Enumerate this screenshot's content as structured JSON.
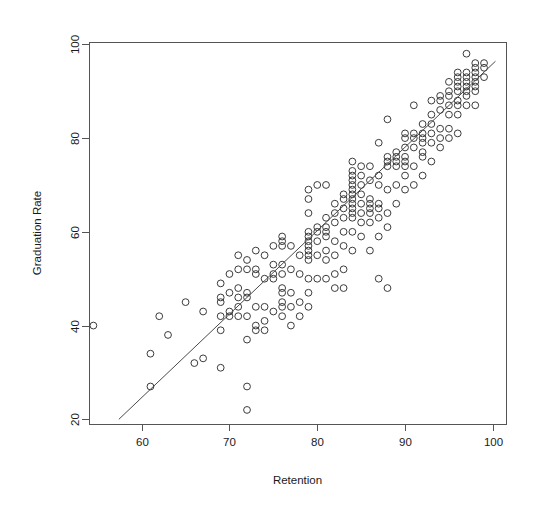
{
  "chart_data": {
    "type": "scatter",
    "title": "",
    "subtitle": "",
    "xlabel": "Retention",
    "ylabel": "Graduation Rate",
    "xlim": [
      54,
      101.5
    ],
    "ylim": [
      19,
      100.5
    ],
    "xticks": [
      60,
      70,
      80,
      90,
      100
    ],
    "yticks": [
      20,
      40,
      60,
      80,
      100
    ],
    "xticklabels": [
      "60",
      "70",
      "80",
      "90",
      "100"
    ],
    "yticklabels": [
      "20",
      "40",
      "60",
      "80",
      "100"
    ],
    "grid": false,
    "legend": null,
    "annotations": [],
    "marker": {
      "shape": "open-circle",
      "radius_px": 3.4,
      "stroke": "#3b3b3b",
      "fill": "none"
    },
    "fit_line": {
      "type": "linear-regression",
      "stroke": "#4a4a4a",
      "x_start": 57.4,
      "y_start": 20.0,
      "x_end": 100.3,
      "y_end": 96.4,
      "slope": 1.78,
      "intercept": -82.2
    },
    "series": [
      {
        "name": "Colleges",
        "n_points": 221,
        "points": [
          [
            54.5,
            40.0
          ],
          [
            61.0,
            27.0
          ],
          [
            61.0,
            34.0
          ],
          [
            62.0,
            42.0
          ],
          [
            63.0,
            38.0
          ],
          [
            65.0,
            45.0
          ],
          [
            66.0,
            32.0
          ],
          [
            67.0,
            33.0
          ],
          [
            67.0,
            43.0
          ],
          [
            69.0,
            31.0
          ],
          [
            69.0,
            39.0
          ],
          [
            69.0,
            42.0
          ],
          [
            69.0,
            45.0
          ],
          [
            69.0,
            46.0
          ],
          [
            69.0,
            49.0
          ],
          [
            70.0,
            42.0
          ],
          [
            70.0,
            43.0
          ],
          [
            70.0,
            47.0
          ],
          [
            70.0,
            51.0
          ],
          [
            71.0,
            42.0
          ],
          [
            71.0,
            44.0
          ],
          [
            71.0,
            46.0
          ],
          [
            71.0,
            48.0
          ],
          [
            71.0,
            52.0
          ],
          [
            71.0,
            55.0
          ],
          [
            72.0,
            22.0
          ],
          [
            72.0,
            27.0
          ],
          [
            72.0,
            37.0
          ],
          [
            72.0,
            42.0
          ],
          [
            72.0,
            46.0
          ],
          [
            72.0,
            47.0
          ],
          [
            72.0,
            52.0
          ],
          [
            72.0,
            54.0
          ],
          [
            73.0,
            39.0
          ],
          [
            73.0,
            40.0
          ],
          [
            73.0,
            44.0
          ],
          [
            73.0,
            51.0
          ],
          [
            73.0,
            52.0
          ],
          [
            73.0,
            56.0
          ],
          [
            74.0,
            39.0
          ],
          [
            74.0,
            41.0
          ],
          [
            74.0,
            44.0
          ],
          [
            74.0,
            50.0
          ],
          [
            74.0,
            55.0
          ],
          [
            75.0,
            43.0
          ],
          [
            75.0,
            50.0
          ],
          [
            75.0,
            51.0
          ],
          [
            75.0,
            53.0
          ],
          [
            75.0,
            57.0
          ],
          [
            76.0,
            42.0
          ],
          [
            76.0,
            44.0
          ],
          [
            76.0,
            45.0
          ],
          [
            76.0,
            47.0
          ],
          [
            76.0,
            48.0
          ],
          [
            76.0,
            51.0
          ],
          [
            76.0,
            53.0
          ],
          [
            76.0,
            57.0
          ],
          [
            76.0,
            58.0
          ],
          [
            76.0,
            59.0
          ],
          [
            77.0,
            40.0
          ],
          [
            77.0,
            44.0
          ],
          [
            77.0,
            47.0
          ],
          [
            77.0,
            52.0
          ],
          [
            77.0,
            57.0
          ],
          [
            78.0,
            42.0
          ],
          [
            78.0,
            45.0
          ],
          [
            78.0,
            51.0
          ],
          [
            78.0,
            55.0
          ],
          [
            79.0,
            44.0
          ],
          [
            79.0,
            47.0
          ],
          [
            79.0,
            50.0
          ],
          [
            79.0,
            54.0
          ],
          [
            79.0,
            55.0
          ],
          [
            79.0,
            56.0
          ],
          [
            79.0,
            57.0
          ],
          [
            79.0,
            58.0
          ],
          [
            79.0,
            59.0
          ],
          [
            79.0,
            60.0
          ],
          [
            79.0,
            64.0
          ],
          [
            79.0,
            67.0
          ],
          [
            79.0,
            69.0
          ],
          [
            80.0,
            50.0
          ],
          [
            80.0,
            55.0
          ],
          [
            80.0,
            58.0
          ],
          [
            80.0,
            60.0
          ],
          [
            80.0,
            61.0
          ],
          [
            80.0,
            70.0
          ],
          [
            81.0,
            50.0
          ],
          [
            81.0,
            54.0
          ],
          [
            81.0,
            56.0
          ],
          [
            81.0,
            59.0
          ],
          [
            81.0,
            60.0
          ],
          [
            81.0,
            61.0
          ],
          [
            81.0,
            63.0
          ],
          [
            81.0,
            70.0
          ],
          [
            82.0,
            48.0
          ],
          [
            82.0,
            51.0
          ],
          [
            82.0,
            55.0
          ],
          [
            82.0,
            58.0
          ],
          [
            82.0,
            62.0
          ],
          [
            82.0,
            64.0
          ],
          [
            82.0,
            66.0
          ],
          [
            83.0,
            48.0
          ],
          [
            83.0,
            52.0
          ],
          [
            83.0,
            57.0
          ],
          [
            83.0,
            60.0
          ],
          [
            83.0,
            63.0
          ],
          [
            83.0,
            65.0
          ],
          [
            83.0,
            67.0
          ],
          [
            83.0,
            68.0
          ],
          [
            84.0,
            56.0
          ],
          [
            84.0,
            60.0
          ],
          [
            84.0,
            63.0
          ],
          [
            84.0,
            64.0
          ],
          [
            84.0,
            65.0
          ],
          [
            84.0,
            66.0
          ],
          [
            84.0,
            67.0
          ],
          [
            84.0,
            68.0
          ],
          [
            84.0,
            69.0
          ],
          [
            84.0,
            70.0
          ],
          [
            84.0,
            71.0
          ],
          [
            84.0,
            72.0
          ],
          [
            84.0,
            73.0
          ],
          [
            84.0,
            75.0
          ],
          [
            85.0,
            59.0
          ],
          [
            85.0,
            62.0
          ],
          [
            85.0,
            64.0
          ],
          [
            85.0,
            66.0
          ],
          [
            85.0,
            68.0
          ],
          [
            85.0,
            70.0
          ],
          [
            85.0,
            72.0
          ],
          [
            85.0,
            74.0
          ],
          [
            86.0,
            56.0
          ],
          [
            86.0,
            62.0
          ],
          [
            86.0,
            64.0
          ],
          [
            86.0,
            65.0
          ],
          [
            86.0,
            66.0
          ],
          [
            86.0,
            67.0
          ],
          [
            86.0,
            71.0
          ],
          [
            86.0,
            74.0
          ],
          [
            87.0,
            50.0
          ],
          [
            87.0,
            59.0
          ],
          [
            87.0,
            63.0
          ],
          [
            87.0,
            65.0
          ],
          [
            87.0,
            66.0
          ],
          [
            87.0,
            70.0
          ],
          [
            87.0,
            72.0
          ],
          [
            87.0,
            79.0
          ],
          [
            88.0,
            48.0
          ],
          [
            88.0,
            61.0
          ],
          [
            88.0,
            64.0
          ],
          [
            88.0,
            69.0
          ],
          [
            88.0,
            74.0
          ],
          [
            88.0,
            75.0
          ],
          [
            88.0,
            76.0
          ],
          [
            88.0,
            84.0
          ],
          [
            89.0,
            66.0
          ],
          [
            89.0,
            70.0
          ],
          [
            89.0,
            74.0
          ],
          [
            89.0,
            75.0
          ],
          [
            89.0,
            76.0
          ],
          [
            89.0,
            77.0
          ],
          [
            90.0,
            69.0
          ],
          [
            90.0,
            72.0
          ],
          [
            90.0,
            74.0
          ],
          [
            90.0,
            75.0
          ],
          [
            90.0,
            76.0
          ],
          [
            90.0,
            78.0
          ],
          [
            90.0,
            80.0
          ],
          [
            90.0,
            81.0
          ],
          [
            91.0,
            70.0
          ],
          [
            91.0,
            74.0
          ],
          [
            91.0,
            78.0
          ],
          [
            91.0,
            80.0
          ],
          [
            91.0,
            81.0
          ],
          [
            91.0,
            87.0
          ],
          [
            92.0,
            72.0
          ],
          [
            92.0,
            76.0
          ],
          [
            92.0,
            77.0
          ],
          [
            92.0,
            79.0
          ],
          [
            92.0,
            80.0
          ],
          [
            92.0,
            81.0
          ],
          [
            92.0,
            83.0
          ],
          [
            93.0,
            75.0
          ],
          [
            93.0,
            79.0
          ],
          [
            93.0,
            81.0
          ],
          [
            93.0,
            83.0
          ],
          [
            93.0,
            85.0
          ],
          [
            93.0,
            88.0
          ],
          [
            94.0,
            78.0
          ],
          [
            94.0,
            80.0
          ],
          [
            94.0,
            82.0
          ],
          [
            94.0,
            86.0
          ],
          [
            94.0,
            88.0
          ],
          [
            94.0,
            89.0
          ],
          [
            95.0,
            80.0
          ],
          [
            95.0,
            82.0
          ],
          [
            95.0,
            85.0
          ],
          [
            95.0,
            87.0
          ],
          [
            95.0,
            89.0
          ],
          [
            95.0,
            90.0
          ],
          [
            95.0,
            92.0
          ],
          [
            96.0,
            81.0
          ],
          [
            96.0,
            85.0
          ],
          [
            96.0,
            87.0
          ],
          [
            96.0,
            88.0
          ],
          [
            96.0,
            90.0
          ],
          [
            96.0,
            91.0
          ],
          [
            96.0,
            92.0
          ],
          [
            96.0,
            93.0
          ],
          [
            96.0,
            94.0
          ],
          [
            97.0,
            87.0
          ],
          [
            97.0,
            89.0
          ],
          [
            97.0,
            90.0
          ],
          [
            97.0,
            91.0
          ],
          [
            97.0,
            92.0
          ],
          [
            97.0,
            93.0
          ],
          [
            97.0,
            94.0
          ],
          [
            97.0,
            98.0
          ],
          [
            98.0,
            87.0
          ],
          [
            98.0,
            90.0
          ],
          [
            98.0,
            91.0
          ],
          [
            98.0,
            92.0
          ],
          [
            98.0,
            93.0
          ],
          [
            98.0,
            94.0
          ],
          [
            98.0,
            95.0
          ],
          [
            98.0,
            96.0
          ],
          [
            99.0,
            93.0
          ],
          [
            99.0,
            95.0
          ],
          [
            99.0,
            96.0
          ]
        ]
      }
    ]
  },
  "plot_geometry": {
    "left_px": 89,
    "right_px": 506,
    "top_px": 42,
    "bottom_px": 424
  }
}
